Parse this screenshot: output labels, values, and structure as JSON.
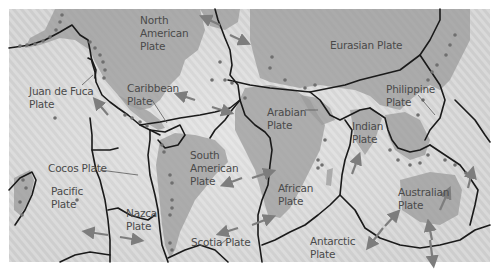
{
  "map": {
    "title": "Tectonic Plates",
    "colors": {
      "ocean": "#cfcfcf",
      "land": "#a8a8a8",
      "boundary": "#1a1a1a",
      "earthquake": "#6f6f6f",
      "arrow": "#7d7d7d",
      "label": "#4a4a4a"
    },
    "labels": {
      "north_american": [
        "North",
        "American",
        "Plate"
      ],
      "eurasian": [
        "Eurasian Plate"
      ],
      "juan_de_fuca": [
        "Juan de Fuca",
        "Plate"
      ],
      "caribbean": [
        "Caribbean",
        "Plate"
      ],
      "arabian": [
        "Arabian",
        "Plate"
      ],
      "philippine": [
        "Philippine",
        "Plate"
      ],
      "cocos": [
        "Cocos Plate"
      ],
      "indian": [
        "Indian",
        "Plate"
      ],
      "pacific": [
        "Pacific",
        "Plate"
      ],
      "nazca": [
        "Nazca",
        "Plate"
      ],
      "south_american": [
        "South",
        "American",
        "Plate"
      ],
      "african": [
        "African",
        "Plate"
      ],
      "australian": [
        "Australian",
        "Plate"
      ],
      "scotia": [
        "Scotia Plate"
      ],
      "antarctic": [
        "Antarctic",
        "Plate"
      ]
    }
  }
}
